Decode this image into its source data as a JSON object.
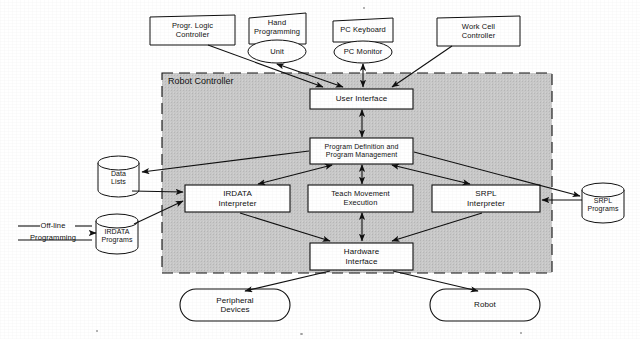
{
  "figure": {
    "type": "architecture-block-diagram",
    "background_color": "#ffffff",
    "container_fill": "#c9c9c9",
    "stroke_color": "#101010"
  },
  "container": {
    "label": "Robot Controller",
    "x": 162,
    "y": 73,
    "width": 390,
    "height": 200,
    "border_style": "dashed",
    "fill": "#c9c9c9"
  },
  "external_nodes": [
    {
      "id": "plc",
      "shape": "box-skew",
      "lines": [
        "Progr. Logic",
        "Controller"
      ],
      "x": 150,
      "y": 15,
      "width": 85,
      "height": 30
    },
    {
      "id": "hand-programming",
      "shape": "box-skew",
      "lines": [
        "Hand",
        "Programming"
      ],
      "x": 248,
      "y": 13,
      "width": 58,
      "height": 30
    },
    {
      "id": "hand-programming-unit",
      "shape": "ellipse",
      "lines": [
        "Unit"
      ],
      "x": 248,
      "y": 40,
      "width": 58,
      "height": 23
    },
    {
      "id": "pc-keyboard",
      "shape": "box-skew",
      "lines": [
        "PC Keyboard"
      ],
      "x": 333,
      "y": 18,
      "width": 60,
      "height": 24
    },
    {
      "id": "pc-monitor",
      "shape": "ellipse",
      "lines": [
        "PC Monitor"
      ],
      "x": 334,
      "y": 41,
      "width": 58,
      "height": 22
    },
    {
      "id": "work-cell-controller",
      "shape": "box-skew",
      "lines": [
        "Work Cell",
        "Controller"
      ],
      "x": 437,
      "y": 16,
      "width": 83,
      "height": 30
    }
  ],
  "internal_nodes": [
    {
      "id": "user-interface",
      "shape": "box",
      "lines": [
        "User Interface"
      ],
      "x": 310,
      "y": 89,
      "width": 103,
      "height": 20
    },
    {
      "id": "program-definition-management",
      "shape": "box",
      "lines": [
        "Program Definition and",
        "Program Management"
      ],
      "x": 310,
      "y": 138,
      "width": 103,
      "height": 26
    },
    {
      "id": "irdata-interpreter",
      "shape": "box",
      "lines": [
        "IRDATA",
        "Interpreter"
      ],
      "x": 185,
      "y": 185,
      "width": 105,
      "height": 27
    },
    {
      "id": "teach-movement-execution",
      "shape": "box",
      "lines": [
        "Teach Movement",
        "Execution"
      ],
      "x": 308,
      "y": 185,
      "width": 105,
      "height": 27
    },
    {
      "id": "srpl-interpreter",
      "shape": "box",
      "lines": [
        "SRPL",
        "Interpreter"
      ],
      "x": 432,
      "y": 185,
      "width": 108,
      "height": 27
    },
    {
      "id": "hardware-interface",
      "shape": "box",
      "lines": [
        "Hardware",
        "Interface"
      ],
      "x": 310,
      "y": 243,
      "width": 103,
      "height": 27
    }
  ],
  "stores": [
    {
      "id": "data-lists",
      "shape": "cylinder",
      "lines": [
        "Data",
        "Lists"
      ],
      "x": 98,
      "y": 156,
      "width": 41,
      "height": 40
    },
    {
      "id": "irdata-programs",
      "shape": "cylinder",
      "lines": [
        "IRDATA",
        "Programs"
      ],
      "x": 96,
      "y": 214,
      "width": 42,
      "height": 40
    },
    {
      "id": "srpl-programs",
      "shape": "cylinder",
      "lines": [
        "SRPL",
        "Programs"
      ],
      "x": 582,
      "y": 183,
      "width": 42,
      "height": 40
    }
  ],
  "terminators": [
    {
      "id": "peripheral-devices",
      "shape": "stadium",
      "lines": [
        "Peripheral",
        "Devices"
      ],
      "x": 180,
      "y": 289,
      "width": 110,
      "height": 32
    },
    {
      "id": "robot",
      "shape": "stadium",
      "lines": [
        "Robot"
      ],
      "x": 430,
      "y": 289,
      "width": 110,
      "height": 32
    }
  ],
  "annotations": [
    {
      "id": "off-line-programming",
      "lines": [
        "Off-line",
        "Programming"
      ],
      "x": 14,
      "y": 218,
      "width": 78,
      "height": 28,
      "style": "text-over-rule"
    }
  ],
  "edges": [
    {
      "from": "plc",
      "to": "user-interface",
      "arrow": "to"
    },
    {
      "from": "hand-programming-unit",
      "to": "user-interface",
      "arrow": "both"
    },
    {
      "from": "pc-monitor",
      "to": "user-interface",
      "arrow": "both"
    },
    {
      "from": "work-cell-controller",
      "to": "user-interface",
      "arrow": "to"
    },
    {
      "from": "user-interface",
      "to": "program-definition-management",
      "arrow": "both"
    },
    {
      "from": "program-definition-management",
      "to": "data-lists",
      "arrow": "to"
    },
    {
      "from": "program-definition-management",
      "to": "irdata-interpreter",
      "arrow": "both"
    },
    {
      "from": "program-definition-management",
      "to": "teach-movement-execution",
      "arrow": "both"
    },
    {
      "from": "program-definition-management",
      "to": "srpl-interpreter",
      "arrow": "both"
    },
    {
      "from": "program-definition-management",
      "to": "srpl-programs",
      "arrow": "to"
    },
    {
      "from": "data-lists",
      "to": "irdata-interpreter",
      "arrow": "to"
    },
    {
      "from": "irdata-programs",
      "to": "irdata-interpreter",
      "arrow": "to"
    },
    {
      "from": "off-line-programming",
      "to": "irdata-programs",
      "arrow": "to"
    },
    {
      "from": "srpl-programs",
      "to": "srpl-interpreter",
      "arrow": "to"
    },
    {
      "from": "irdata-interpreter",
      "to": "hardware-interface",
      "arrow": "to"
    },
    {
      "from": "teach-movement-execution",
      "to": "hardware-interface",
      "arrow": "both"
    },
    {
      "from": "srpl-interpreter",
      "to": "hardware-interface",
      "arrow": "to"
    },
    {
      "from": "hardware-interface",
      "to": "peripheral-devices",
      "arrow": "to"
    },
    {
      "from": "hardware-interface",
      "to": "robot",
      "arrow": "to"
    }
  ]
}
